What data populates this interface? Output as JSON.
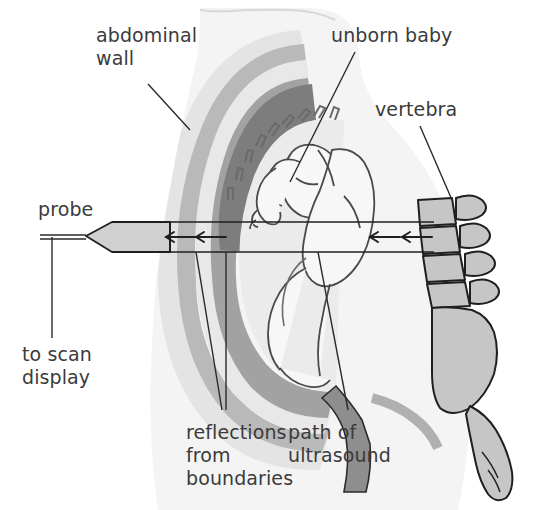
{
  "figure": {
    "width": 549,
    "height": 510,
    "background": "#ffffff"
  },
  "labels": {
    "abdominal_wall": "abdominal\nwall",
    "unborn_baby": "unborn baby",
    "vertebra": "vertebra",
    "probe": "probe",
    "to_scan_display": "to scan\ndisplay",
    "reflections_from_boundaries": "reflections\nfrom\nboundaries",
    "path_of_ultrasound": "path of\nultrasound"
  },
  "colors": {
    "ink": "#3b3b3b",
    "outline": "#222222",
    "body_fill": "#f2f2f2",
    "abdominal_wall_fill": "#ececed",
    "fat_layer": "#b4b4b4",
    "muscle_layer": "#e2e2e2",
    "uterus_wall": "#a8a8a8",
    "placenta": "#8f8f8f",
    "amniotic_fluid": "#e8e8e8",
    "fetus_fill": "#f6f6f6",
    "bone_fill": "#c8c8c8",
    "probe_fill": "#d2d2d2",
    "cervix_fill": "#9a9a9a"
  },
  "diagram_elements": {
    "probe": {
      "name": "ultrasound probe",
      "shape": "tapered transducer with cable to the left",
      "cable_label": "to scan display"
    },
    "beam": {
      "name": "path of ultrasound",
      "description": "horizontal beam band crossing the abdomen from probe to vertebra",
      "reflection_arrow_count": 4,
      "arrow_direction": "left (back toward probe)"
    },
    "layers_outside_in": [
      "abdominal wall",
      "fat layer",
      "muscle layer",
      "uterus wall",
      "amniotic fluid",
      "unborn baby"
    ],
    "spine": {
      "name": "vertebral column",
      "vertebra_count": 4,
      "includes": "sacrum and coccyx"
    }
  }
}
